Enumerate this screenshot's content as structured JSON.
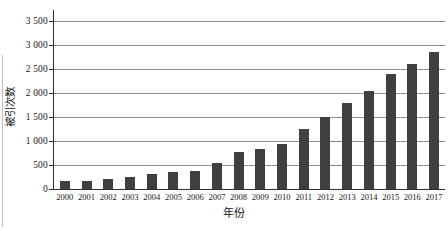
{
  "chart_data": {
    "type": "bar",
    "title": "",
    "xlabel": "年份",
    "ylabel": "被引次数",
    "categories": [
      "2000",
      "2001",
      "2002",
      "2003",
      "2004",
      "2005",
      "2006",
      "2007",
      "2008",
      "2009",
      "2010",
      "2011",
      "2012",
      "2013",
      "2014",
      "2015",
      "2016",
      "2017"
    ],
    "values": [
      170,
      170,
      210,
      250,
      305,
      350,
      385,
      540,
      765,
      830,
      930,
      1260,
      1490,
      1790,
      2050,
      2400,
      2600,
      2860
    ],
    "ylim": [
      0,
      3500
    ],
    "ytick_interval": 500,
    "ytick_labels": [
      "0",
      "500",
      "1 000",
      "1 500",
      "2 000",
      "2 500",
      "3 000",
      "3 500"
    ],
    "grid": "horizontal",
    "legend": "none",
    "bar_color": "#404040",
    "gridline_color": "#8d8d8d",
    "axis_color": "#2f2f2f",
    "text_color": "#161616"
  }
}
